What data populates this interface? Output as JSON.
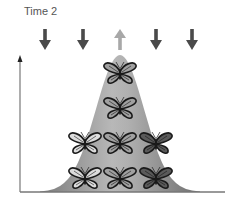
{
  "diagram": {
    "title": "Time 2",
    "arrows": [
      {
        "x": 45,
        "direction": "down",
        "color": "#4a4a4a"
      },
      {
        "x": 83,
        "direction": "down",
        "color": "#4a4a4a"
      },
      {
        "x": 120,
        "direction": "up",
        "color": "#a8a8a8"
      },
      {
        "x": 156,
        "direction": "down",
        "color": "#4a4a4a"
      },
      {
        "x": 192,
        "direction": "down",
        "color": "#4a4a4a"
      }
    ],
    "curve": {
      "type": "bell",
      "center_x": 120,
      "peak_y": 55,
      "base_y": 192,
      "fill": "#8c8c8c"
    },
    "butterflies": [
      {
        "column": "light",
        "x": 85,
        "y": 143,
        "shade": "#dcdcdc"
      },
      {
        "column": "light",
        "x": 85,
        "y": 178,
        "shade": "#dcdcdc"
      },
      {
        "column": "medium",
        "x": 120,
        "y": 73,
        "shade": "#a0a0a0"
      },
      {
        "column": "medium",
        "x": 120,
        "y": 108,
        "shade": "#a0a0a0"
      },
      {
        "column": "medium",
        "x": 120,
        "y": 143,
        "shade": "#a0a0a0"
      },
      {
        "column": "medium",
        "x": 120,
        "y": 178,
        "shade": "#a0a0a0"
      },
      {
        "column": "dark",
        "x": 156,
        "y": 143,
        "shade": "#5a5a5a"
      },
      {
        "column": "dark",
        "x": 156,
        "y": 178,
        "shade": "#5a5a5a"
      }
    ]
  }
}
